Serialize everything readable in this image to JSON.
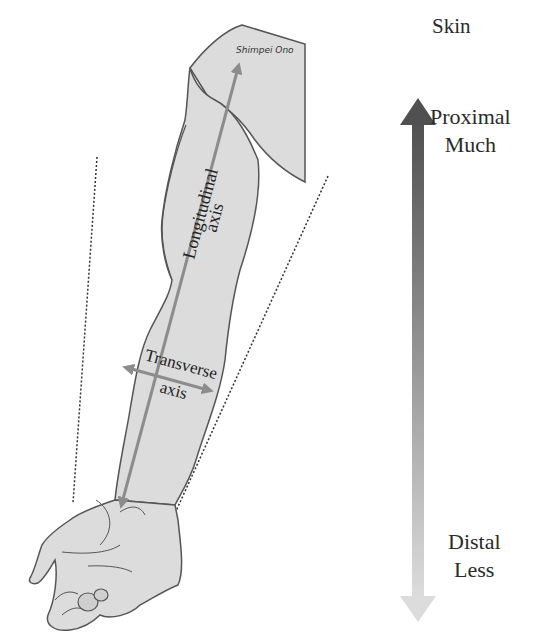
{
  "diagram": {
    "signature": "Shimpei Ono",
    "arm_labels": {
      "longitudinal": {
        "line1": "Longitudinal",
        "line2": "axis"
      },
      "transverse": {
        "line1": "Transverse",
        "line2": "axis"
      }
    },
    "scale": {
      "title": "Skin",
      "top": {
        "line1": "Proximal",
        "line2": "Much"
      },
      "bottom": {
        "line1": "Distal",
        "line2": "Less"
      },
      "gradient_top_color": "#555555",
      "gradient_bottom_color": "#d9d9d9"
    },
    "colors": {
      "arm_fill": "#dcdcdc",
      "arm_outline": "#555555",
      "axis_arrow": "#8c8c8c",
      "dotted_line": "#333333"
    }
  }
}
